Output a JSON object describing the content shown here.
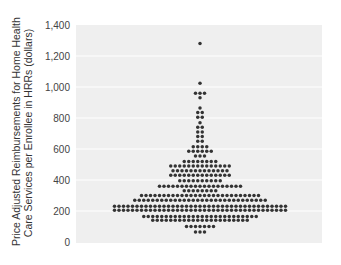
{
  "chart_data": {
    "type": "scatter",
    "subtype": "beeswarm / dot plot",
    "title": "",
    "xlabel": "",
    "ylabel": "Price Adjusted Reimbursements  for Home Health Care Services per Enrollee in HRRs (dollars)",
    "ylabel_lines": [
      "Price Adjusted Reimbursements  for Home Health",
      "Care Services per Enrollee in HRRs (dollars)"
    ],
    "ylim": [
      0,
      1400
    ],
    "yticks": [
      0,
      200,
      400,
      600,
      800,
      1000,
      1200,
      1400
    ],
    "ytick_labels": [
      "0",
      "200",
      "400",
      "600",
      "800",
      "1,000",
      "1,200",
      "1,400"
    ],
    "grid": "horizontal white gridlines",
    "background": "#efefef",
    "dot_color": "#333333",
    "rows": [
      {
        "value": 1280,
        "count": 1
      },
      {
        "value": 1025,
        "count": 1
      },
      {
        "value": 960,
        "count": 3
      },
      {
        "value": 930,
        "count": 1
      },
      {
        "value": 865,
        "count": 1
      },
      {
        "value": 835,
        "count": 2
      },
      {
        "value": 805,
        "count": 2
      },
      {
        "value": 770,
        "count": 1
      },
      {
        "value": 740,
        "count": 2
      },
      {
        "value": 710,
        "count": 2
      },
      {
        "value": 680,
        "count": 2
      },
      {
        "value": 650,
        "count": 2
      },
      {
        "value": 615,
        "count": 4
      },
      {
        "value": 585,
        "count": 6
      },
      {
        "value": 555,
        "count": 3
      },
      {
        "value": 520,
        "count": 8
      },
      {
        "value": 490,
        "count": 14
      },
      {
        "value": 460,
        "count": 13
      },
      {
        "value": 430,
        "count": 14
      },
      {
        "value": 395,
        "count": 10
      },
      {
        "value": 360,
        "count": 19
      },
      {
        "value": 330,
        "count": 8
      },
      {
        "value": 300,
        "count": 27
      },
      {
        "value": 270,
        "count": 30
      },
      {
        "value": 230,
        "count": 39
      },
      {
        "value": 205,
        "count": 39
      },
      {
        "value": 165,
        "count": 26
      },
      {
        "value": 140,
        "count": 22
      },
      {
        "value": 100,
        "count": 7
      },
      {
        "value": 65,
        "count": 3
      }
    ]
  }
}
